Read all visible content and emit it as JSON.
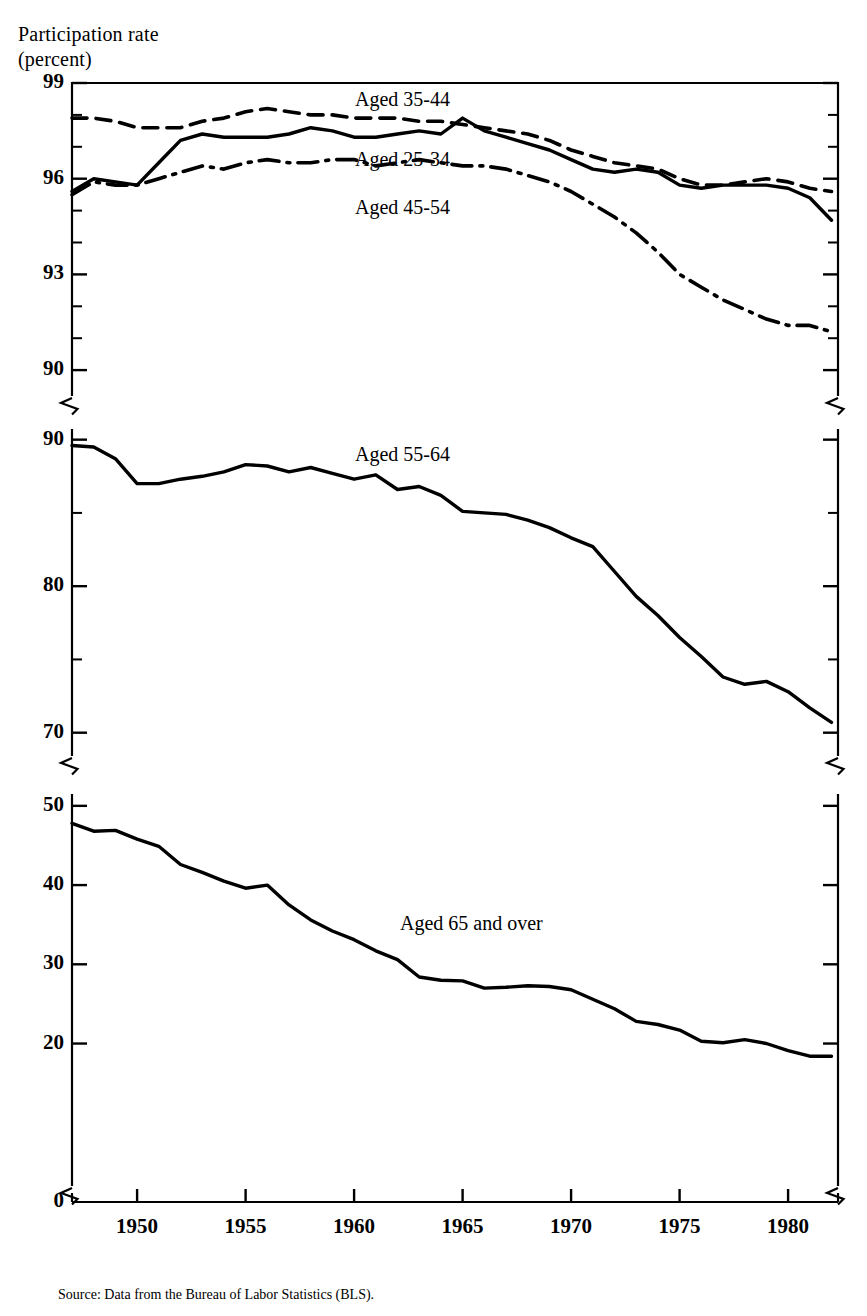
{
  "axis_title": {
    "line1": "Participation rate",
    "line2": "(percent)"
  },
  "source_note": "Source:  Data from the Bureau of Labor Statistics (BLS).",
  "series_labels": {
    "a3544": "Aged 35-44",
    "a2534": "Aged 25-34",
    "a4554": "Aged 45-54",
    "a5564": "Aged 55-64",
    "a65": "Aged 65 and over"
  },
  "y_ticks": {
    "panel1": [
      "99",
      "96",
      "93",
      "90"
    ],
    "panel2": [
      "90",
      "80",
      "70"
    ],
    "panel3": [
      "50",
      "40",
      "30",
      "20"
    ],
    "zero": "0"
  },
  "x_ticks": [
    "1950",
    "1955",
    "1960",
    "1965",
    "1970",
    "1975",
    "1980"
  ],
  "chart_data": {
    "type": "line",
    "xlabel": "",
    "ylabel": "Participation rate (percent)",
    "xlim": [
      1947,
      1982
    ],
    "grid": false,
    "legend": "inline-labels",
    "panels": [
      {
        "name": "panel-top",
        "ylim": [
          89,
          99
        ],
        "ytick_major": [
          99,
          96,
          93,
          90
        ],
        "ytick_minor_step": 1,
        "series": [
          {
            "name": "Aged 35-44",
            "style": "dashed",
            "x": [
              1947,
              1948,
              1949,
              1950,
              1951,
              1952,
              1953,
              1954,
              1955,
              1956,
              1957,
              1958,
              1959,
              1960,
              1961,
              1962,
              1963,
              1964,
              1965,
              1966,
              1967,
              1968,
              1969,
              1970,
              1971,
              1972,
              1973,
              1974,
              1975,
              1976,
              1977,
              1978,
              1979,
              1980,
              1981,
              1982
            ],
            "y": [
              97.9,
              97.9,
              97.8,
              97.6,
              97.6,
              97.6,
              97.8,
              97.9,
              98.1,
              98.2,
              98.1,
              98.0,
              98.0,
              97.9,
              97.9,
              97.9,
              97.8,
              97.8,
              97.7,
              97.6,
              97.5,
              97.4,
              97.2,
              96.9,
              96.7,
              96.5,
              96.4,
              96.3,
              96.0,
              95.8,
              95.8,
              95.9,
              96.0,
              95.9,
              95.7,
              95.6
            ]
          },
          {
            "name": "Aged 25-34",
            "style": "solid",
            "x": [
              1947,
              1948,
              1949,
              1950,
              1951,
              1952,
              1953,
              1954,
              1955,
              1956,
              1957,
              1958,
              1959,
              1960,
              1961,
              1962,
              1963,
              1964,
              1965,
              1966,
              1967,
              1968,
              1969,
              1970,
              1971,
              1972,
              1973,
              1974,
              1975,
              1976,
              1977,
              1978,
              1979,
              1980,
              1981,
              1982
            ],
            "y": [
              95.6,
              96.0,
              95.9,
              95.8,
              96.5,
              97.2,
              97.4,
              97.3,
              97.3,
              97.3,
              97.4,
              97.6,
              97.5,
              97.3,
              97.3,
              97.4,
              97.5,
              97.4,
              97.9,
              97.5,
              97.3,
              97.1,
              96.9,
              96.6,
              96.3,
              96.2,
              96.3,
              96.2,
              95.8,
              95.7,
              95.8,
              95.8,
              95.8,
              95.7,
              95.4,
              94.7
            ]
          },
          {
            "name": "Aged 45-54",
            "style": "dashdot",
            "x": [
              1947,
              1948,
              1949,
              1950,
              1951,
              1952,
              1953,
              1954,
              1955,
              1956,
              1957,
              1958,
              1959,
              1960,
              1961,
              1962,
              1963,
              1964,
              1965,
              1966,
              1967,
              1968,
              1969,
              1970,
              1971,
              1972,
              1973,
              1974,
              1975,
              1976,
              1977,
              1978,
              1979,
              1980,
              1981,
              1982
            ],
            "y": [
              95.5,
              95.9,
              95.8,
              95.8,
              96.0,
              96.2,
              96.4,
              96.3,
              96.5,
              96.6,
              96.5,
              96.5,
              96.6,
              96.6,
              96.4,
              96.5,
              96.6,
              96.5,
              96.4,
              96.4,
              96.3,
              96.1,
              95.9,
              95.6,
              95.2,
              94.8,
              94.3,
              93.7,
              93.0,
              92.6,
              92.2,
              91.9,
              91.6,
              91.4,
              91.4,
              91.2
            ]
          }
        ]
      },
      {
        "name": "panel-middle",
        "ylim": [
          68,
          91
        ],
        "ytick_major": [
          90,
          80,
          70
        ],
        "series": [
          {
            "name": "Aged 55-64",
            "style": "solid",
            "x": [
              1947,
              1948,
              1949,
              1950,
              1951,
              1952,
              1953,
              1954,
              1955,
              1956,
              1957,
              1958,
              1959,
              1960,
              1961,
              1962,
              1963,
              1964,
              1965,
              1966,
              1967,
              1968,
              1969,
              1970,
              1971,
              1972,
              1973,
              1974,
              1975,
              1976,
              1977,
              1978,
              1979,
              1980,
              1981,
              1982
            ],
            "y": [
              89.6,
              89.5,
              88.7,
              87.0,
              87.0,
              87.3,
              87.5,
              87.8,
              88.3,
              88.2,
              87.8,
              88.1,
              87.7,
              87.3,
              87.6,
              86.6,
              86.8,
              86.2,
              85.1,
              85.0,
              84.9,
              84.5,
              84.0,
              83.3,
              82.7,
              81.0,
              79.3,
              78.0,
              76.5,
              75.2,
              73.8,
              73.3,
              73.5,
              72.8,
              71.7,
              70.7
            ]
          }
        ]
      },
      {
        "name": "panel-bottom",
        "ylim": [
          0,
          52
        ],
        "ytick_major": [
          50,
          40,
          30,
          20,
          0
        ],
        "series": [
          {
            "name": "Aged 65 and over",
            "style": "solid",
            "x": [
              1947,
              1948,
              1949,
              1950,
              1951,
              1952,
              1953,
              1954,
              1955,
              1956,
              1957,
              1958,
              1959,
              1960,
              1961,
              1962,
              1963,
              1964,
              1965,
              1966,
              1967,
              1968,
              1969,
              1970,
              1971,
              1972,
              1973,
              1974,
              1975,
              1976,
              1977,
              1978,
              1979,
              1980,
              1981,
              1982
            ],
            "y": [
              47.8,
              46.8,
              46.9,
              45.8,
              44.9,
              42.6,
              41.6,
              40.5,
              39.6,
              40.0,
              37.5,
              35.6,
              34.2,
              33.1,
              31.7,
              30.6,
              28.4,
              28.0,
              27.9,
              27.0,
              27.1,
              27.3,
              27.2,
              26.8,
              25.6,
              24.4,
              22.8,
              22.4,
              21.7,
              20.3,
              20.1,
              20.5,
              20.0,
              19.1,
              18.4,
              18.4
            ]
          }
        ]
      }
    ]
  }
}
